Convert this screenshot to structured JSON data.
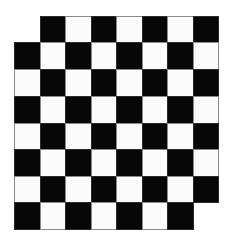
{
  "board": {
    "title": "Checkerboard with two missing corner squares",
    "rows": 8,
    "cols": 8,
    "col_edges": [
      14,
      40,
      65,
      91,
      116,
      142,
      167,
      193,
      218
    ],
    "row_edges": [
      16,
      42,
      69,
      96,
      123,
      149,
      176,
      202,
      229
    ],
    "dark_when_row_plus_col": "odd",
    "missing_squares": [
      {
        "row": 0,
        "col": 0
      },
      {
        "row": 7,
        "col": 7
      }
    ],
    "colors": {
      "dark": "#070707",
      "light": "#fbfbfb",
      "outline": "#8a8a8a",
      "background": "#ffffff"
    }
  }
}
